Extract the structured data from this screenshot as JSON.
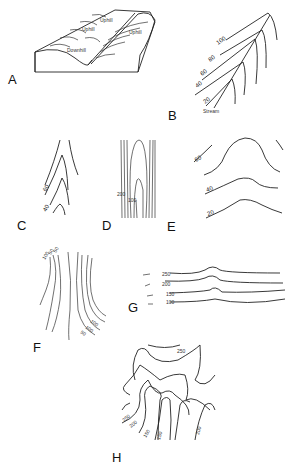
{
  "figure": {
    "panels": [
      {
        "id": "A",
        "label": "A",
        "annotations": [
          "Uphill",
          "Uphill",
          "Uphill",
          "Downhill"
        ]
      },
      {
        "id": "B",
        "label": "B",
        "contour_labels": [
          "100",
          "80",
          "60",
          "40",
          "20"
        ],
        "feature_label": "Stream"
      },
      {
        "id": "C",
        "label": "C",
        "contour_labels": [
          "60",
          "40"
        ]
      },
      {
        "id": "D",
        "label": "D",
        "contour_labels": [
          "200",
          "100"
        ]
      },
      {
        "id": "E",
        "label": "E",
        "contour_labels": [
          "60",
          "40",
          "20"
        ]
      },
      {
        "id": "F",
        "label": "F",
        "contour_labels_top": [
          "100",
          "50",
          "50"
        ],
        "contour_labels_bottom": [
          "100",
          "100",
          "50"
        ]
      },
      {
        "id": "G",
        "label": "G",
        "contour_labels": [
          "250",
          "200",
          "150",
          "100"
        ]
      },
      {
        "id": "H",
        "label": "H",
        "contour_labels": [
          "250",
          "250",
          "200",
          "150",
          "150",
          "200"
        ]
      }
    ]
  }
}
